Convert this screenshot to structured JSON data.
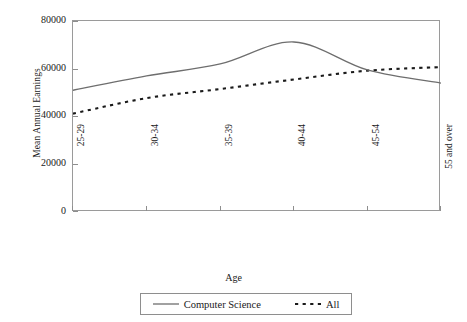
{
  "chart_data": {
    "type": "line",
    "title": "",
    "xlabel": "Age",
    "ylabel": "Mean Annual Earnings",
    "categories": [
      "25-29",
      "30-34",
      "35-39",
      "40-44",
      "45-54",
      "55 and over"
    ],
    "ylim": [
      0,
      80000
    ],
    "yticks": [
      0,
      20000,
      40000,
      60000,
      80000
    ],
    "ytick_labels": [
      "0",
      "20000",
      "40000",
      "60000",
      "80000"
    ],
    "grid": false,
    "legend_position": "bottom",
    "series": [
      {
        "name": "Computer Science",
        "style": "solid",
        "color": "#6e6e6e",
        "values": [
          51000,
          57000,
          62000,
          71200,
          59500,
          54000
        ]
      },
      {
        "name": "All",
        "style": "dotted",
        "color": "#1a1a1a",
        "values": [
          41200,
          47700,
          51500,
          55500,
          59200,
          60700
        ]
      }
    ]
  },
  "axes": {
    "y_title": "Mean Annual Earnings",
    "x_title": "Age",
    "ytick_labels": [
      "80000",
      "60000",
      "40000",
      "20000",
      "0"
    ],
    "xtick_labels": [
      "25-29",
      "30-34",
      "35-39",
      "40-44",
      "45-54",
      "55 and over"
    ]
  },
  "legend": {
    "entries": [
      {
        "label": "Computer Science",
        "marker": "solid-line-swatch"
      },
      {
        "label": "All",
        "marker": "dotted-line-swatch"
      }
    ]
  }
}
